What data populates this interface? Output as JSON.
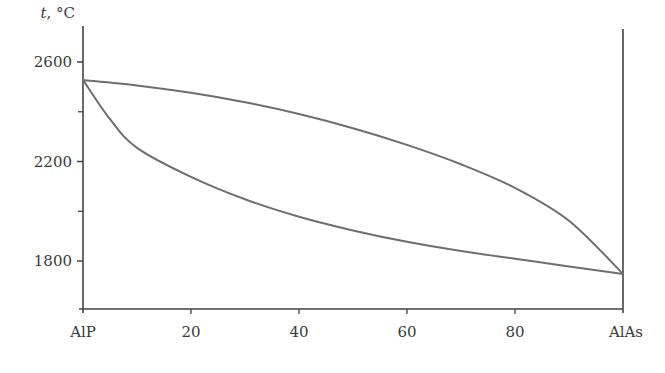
{
  "chart_data": {
    "type": "line",
    "title": "",
    "xlabel": "",
    "ylabel": "t, °C",
    "x_tick_labels": [
      "AlP",
      "20",
      "40",
      "60",
      "80",
      "AlAs"
    ],
    "x_ticks": [
      0,
      20,
      40,
      60,
      80,
      100
    ],
    "y_tick_labels": [
      "2600",
      "2200",
      "1800"
    ],
    "y_ticks": [
      2600,
      2200,
      1800
    ],
    "y_minor_ticks": [
      2400,
      2000
    ],
    "xlim": [
      0,
      100
    ],
    "ylim": [
      1600,
      2740
    ],
    "grid": false,
    "legend": null,
    "series": [
      {
        "name": "liquidus",
        "x": [
          0,
          10,
          20,
          30,
          40,
          50,
          60,
          70,
          80,
          90,
          100
        ],
        "values": [
          2528,
          2506,
          2476,
          2438,
          2391,
          2334,
          2267,
          2189,
          2094,
          1962,
          1748
        ]
      },
      {
        "name": "solidus",
        "x": [
          0,
          5,
          10,
          20,
          30,
          40,
          50,
          60,
          70,
          80,
          90,
          100
        ],
        "values": [
          2528,
          2370,
          2255,
          2138,
          2048,
          1978,
          1923,
          1877,
          1840,
          1809,
          1778,
          1748
        ]
      }
    ],
    "colors": {
      "axes": "#444444",
      "curves": "#6e6e6e",
      "text": "#3a3a3a"
    }
  }
}
